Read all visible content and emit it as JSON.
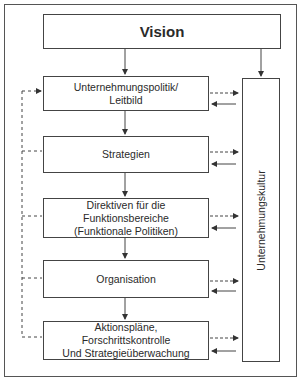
{
  "diagram": {
    "vision": {
      "label": "Vision"
    },
    "culture": {
      "label": "Unternehmungskultur"
    },
    "steps": [
      {
        "lines": [
          "Unternehmungspolitik/",
          "Leitbild"
        ]
      },
      {
        "lines": [
          "Strategien"
        ]
      },
      {
        "lines": [
          "Direktiven für die",
          "Funktionsbereiche",
          "(Funktionale Politiken)"
        ]
      },
      {
        "lines": [
          "Organisation"
        ]
      },
      {
        "lines": [
          "Aktionspläne,",
          "Forschrittskontrolle",
          "Und Strategieüberwachung"
        ]
      }
    ],
    "colors": {
      "line": "#444444",
      "text": "#2a2a2a",
      "background": "#ffffff"
    }
  }
}
